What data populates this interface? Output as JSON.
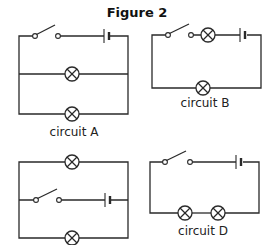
{
  "figure": {
    "title": "Figure 2"
  },
  "circuits": [
    {
      "id": "A",
      "label": "circuit A",
      "components": [
        "switch",
        "cell",
        "lamp",
        "lamp"
      ],
      "arrangement": "switch and cell in top branch; two lamps in parallel branches"
    },
    {
      "id": "B",
      "label": "circuit B",
      "components": [
        "switch",
        "lamp",
        "cell",
        "lamp"
      ],
      "arrangement": "series loop: switch, lamp, cell on top; lamp on bottom"
    },
    {
      "id": "C",
      "label": "",
      "components": [
        "lamp",
        "switch",
        "cell",
        "lamp"
      ],
      "arrangement": "lamp top branch; switch and cell middle branch; lamp bottom branch"
    },
    {
      "id": "D",
      "label": "circuit D",
      "components": [
        "switch",
        "cell",
        "lamp",
        "lamp"
      ],
      "arrangement": "series loop: switch and cell on top; two lamps on bottom"
    }
  ],
  "colors": {
    "line": "#2a2a2a",
    "background": "#ffffff"
  }
}
